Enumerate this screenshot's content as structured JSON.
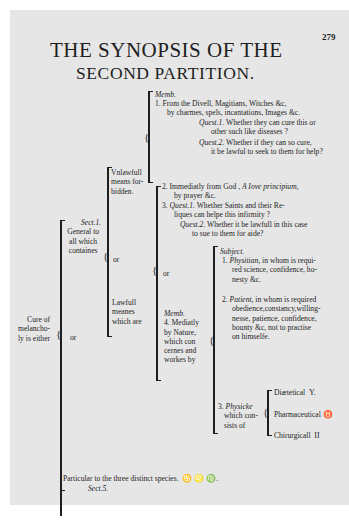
{
  "page_number": "279",
  "title": {
    "line1": "THE SYNOPSIS OF THE",
    "line2": "SECOND PARTITION."
  },
  "root": {
    "label_lines": [
      "Cure of",
      "melancho-",
      "ly is either"
    ],
    "connector": "or"
  },
  "general": {
    "section_tag": "Sect.1.",
    "label_lines": [
      "General to",
      "all which",
      "containes"
    ],
    "connector": "or"
  },
  "unlawful": {
    "label_lines": [
      "Vnlawfull",
      "means for-",
      "bidden."
    ],
    "member_tag": "Memb.",
    "item1_lines": [
      "1.  From the Divell, Magitians, Witches &c,",
      "by charmes, spels, incantations, Images &c."
    ],
    "quest1_tag": "Quest.1.",
    "quest1_lines": [
      "Whether they can cure this or",
      "other such like diseases ?"
    ],
    "quest2_tag": "Quest.2.",
    "quest2_lines": [
      "Whether if they can so cure,",
      "it be lawful to seek to them for help?"
    ]
  },
  "lawful": {
    "label_lines": [
      "Lawfull",
      "meanes",
      "which are"
    ],
    "connector": "or",
    "item2_line1_prefix": "2.  Immediatly from God ,",
    "item2_line1_italic": "A Iove principium,",
    "item2_line2": "by prayer &c.",
    "item3_prefix": "3.",
    "item3_quest1_tag": "Quest.1.",
    "item3_quest1_lines": [
      "Whether Saints and their Re-",
      "liques can helpe this infirmity ?"
    ],
    "item3_quest2_tag": "Quest.2.",
    "item3_quest2_lines": [
      "Whether it be lawfull in this case",
      "to sue to them for aide?"
    ],
    "mediately": {
      "member_tag": "Memb.",
      "label_lines": [
        "4. Mediatly",
        "by Nature,",
        "which con",
        "cernes and",
        "workes by"
      ],
      "subject_tag": "Subject.",
      "physitian_prefix": "1.",
      "physitian_term": "Physitian,",
      "physitian_lines": [
        "in whom is requi-",
        "red science, confidence, ho-",
        "nesty &c."
      ],
      "patient_prefix": "2.",
      "patient_term": "Patient,",
      "patient_lines": [
        "in whom is required",
        "obedience,constancy,willing-",
        "nesse, patience, confidence,",
        "bounty &c, not to practise",
        "on himselfe."
      ],
      "physick_prefix": "3.",
      "physick_term": "Physicke",
      "physick_lines": [
        "which con-",
        "sists of"
      ],
      "physick_kinds": [
        {
          "label": "Diætetical",
          "ref": "Y."
        },
        {
          "label": "Pharmaceutical",
          "ref": "♉"
        },
        {
          "label": "Chirurgicall",
          "ref": "II"
        }
      ]
    }
  },
  "particular": {
    "text": "Particular to the three distinct species.",
    "signs": "♋ ♌ ♍.",
    "section_tag": "Sect.5."
  }
}
